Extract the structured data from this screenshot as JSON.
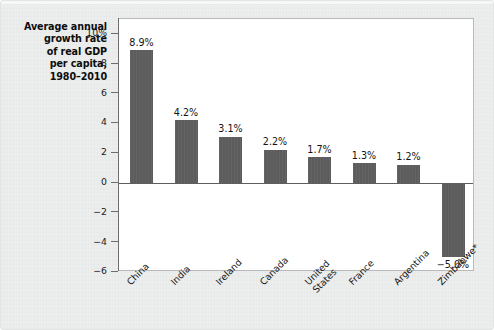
{
  "chart_data": {
    "type": "bar",
    "title": "Average annual growth rate of real GDP per capita, 1980–2010",
    "title_lines": [
      "Average annual",
      "growth rate",
      "of real GDP",
      "per capita,",
      "1980–2010"
    ],
    "categories": [
      "China",
      "India",
      "Ireland",
      "Canada",
      "United States",
      "France",
      "Argentina",
      "Zimbabwe*"
    ],
    "category_lines": [
      [
        "China"
      ],
      [
        "India"
      ],
      [
        "Ireland"
      ],
      [
        "Canada"
      ],
      [
        "United",
        "States"
      ],
      [
        "France"
      ],
      [
        "Argentina"
      ],
      [
        "Zimbabwe*"
      ]
    ],
    "values": [
      8.9,
      4.2,
      3.1,
      2.2,
      1.7,
      1.3,
      1.2,
      -5.0
    ],
    "value_labels": [
      "8.9%",
      "4.2%",
      "3.1%",
      "2.2%",
      "1.7%",
      "1.3%",
      "1.2%",
      "−5.0%"
    ],
    "xlabel": "",
    "ylabel": "",
    "ylim": [
      -6,
      11
    ],
    "yticks": [
      10,
      8,
      6,
      4,
      2,
      0,
      -2,
      -4,
      -6
    ],
    "ytick_labels": [
      "10%",
      "8",
      "6",
      "4",
      "2",
      "0",
      "−2",
      "−4",
      "−6"
    ],
    "grid": false,
    "legend": false,
    "bar_color": "#5c5c5c",
    "plot_background": "#ffffff",
    "figure_background": "#eceded"
  }
}
